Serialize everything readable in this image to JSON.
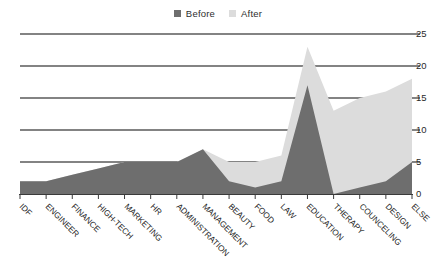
{
  "legend": {
    "position": "top-center",
    "items": [
      {
        "label": "Before",
        "color": "#6e6e6e",
        "icon": "square-swatch-icon"
      },
      {
        "label": "After",
        "color": "#dcdcdc",
        "icon": "square-swatch-icon"
      }
    ]
  },
  "axes": {
    "y": {
      "ticks": [
        "0",
        "5",
        "10",
        "15",
        "20",
        "25"
      ],
      "min": 0,
      "max": 25,
      "step": 5,
      "position": "right"
    }
  },
  "colors": {
    "before": "#6e6e6e",
    "after": "#dcdcdc",
    "gridline": "#5a5a5a",
    "axis": "#3a3a3a",
    "text": "#242424",
    "background": "#ffffff"
  },
  "chart_data": {
    "type": "area",
    "title": "",
    "subtitle": "",
    "xlabel": "",
    "ylabel": "",
    "ylim": [
      0,
      25
    ],
    "ytick_values": [
      0,
      5,
      10,
      15,
      20,
      25
    ],
    "grid": true,
    "grid_axis": "y",
    "legend_position": "top-center",
    "stacked": false,
    "overlap": "overlaid",
    "categories": [
      "IDF",
      "ENGINEER",
      "FINANCE",
      "HIGH-TECH",
      "MARKETING",
      "HR",
      "ADMINISTRATION",
      "MANAGEMENT",
      "BEAUTY",
      "FOOD",
      "LAW",
      "EDUCATION",
      "THERAPY",
      "COUNCELING",
      "DESIGN",
      "ELSE"
    ],
    "series": [
      {
        "name": "After",
        "color": "#dcdcdc",
        "values": [
          2,
          2,
          3,
          4,
          5,
          5,
          5,
          7,
          5,
          5,
          6,
          23,
          13,
          15,
          16,
          18
        ]
      },
      {
        "name": "Before",
        "color": "#6e6e6e",
        "values": [
          2,
          2,
          3,
          4,
          5,
          5,
          5,
          7,
          2,
          1,
          2,
          17,
          0,
          1,
          2,
          5
        ]
      }
    ]
  }
}
